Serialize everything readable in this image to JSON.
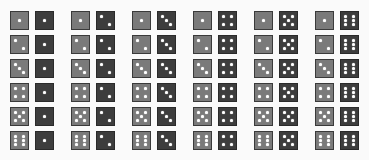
{
  "layout": {
    "rows": 6,
    "groups": 6,
    "group_origin_x": 10,
    "group_pitch_x": 61,
    "row_origin_y": 11,
    "row_pitch_y": 24
  },
  "colors": {
    "background": "#fafafa",
    "light_die": "#7a7a7a",
    "dark_die": "#3d3d3d",
    "pip": "#ffffff"
  },
  "pairs": [
    {
      "light": 1,
      "dark": 1
    },
    {
      "light": 1,
      "dark": 2
    },
    {
      "light": 1,
      "dark": 3
    },
    {
      "light": 1,
      "dark": 4
    },
    {
      "light": 1,
      "dark": 5
    },
    {
      "light": 1,
      "dark": 6
    },
    {
      "light": 2,
      "dark": 1
    },
    {
      "light": 2,
      "dark": 2
    },
    {
      "light": 2,
      "dark": 3
    },
    {
      "light": 2,
      "dark": 4
    },
    {
      "light": 2,
      "dark": 5
    },
    {
      "light": 2,
      "dark": 6
    },
    {
      "light": 3,
      "dark": 1
    },
    {
      "light": 3,
      "dark": 2
    },
    {
      "light": 3,
      "dark": 3
    },
    {
      "light": 3,
      "dark": 4
    },
    {
      "light": 3,
      "dark": 5
    },
    {
      "light": 3,
      "dark": 6
    },
    {
      "light": 4,
      "dark": 1
    },
    {
      "light": 4,
      "dark": 2
    },
    {
      "light": 4,
      "dark": 3
    },
    {
      "light": 4,
      "dark": 4
    },
    {
      "light": 4,
      "dark": 5
    },
    {
      "light": 4,
      "dark": 6
    },
    {
      "light": 5,
      "dark": 1
    },
    {
      "light": 5,
      "dark": 2
    },
    {
      "light": 5,
      "dark": 3
    },
    {
      "light": 5,
      "dark": 4
    },
    {
      "light": 5,
      "dark": 5
    },
    {
      "light": 5,
      "dark": 6
    },
    {
      "light": 6,
      "dark": 1
    },
    {
      "light": 6,
      "dark": 2
    },
    {
      "light": 6,
      "dark": 3
    },
    {
      "light": 6,
      "dark": 4
    },
    {
      "light": 6,
      "dark": 5
    },
    {
      "light": 6,
      "dark": 6
    }
  ]
}
